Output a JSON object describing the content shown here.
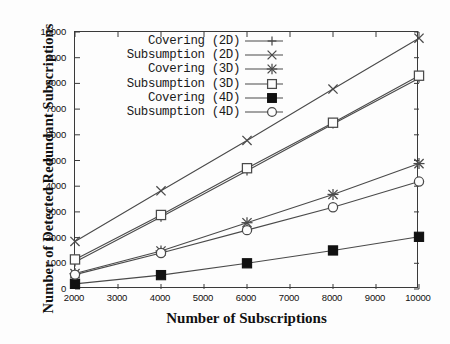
{
  "chart_data": {
    "type": "line",
    "title": "",
    "xlabel": "Number of Subscriptions",
    "ylabel": "Number of Detected Redundant Subscriptions",
    "xlim": [
      2000,
      10000
    ],
    "ylim": [
      0,
      10000
    ],
    "xticks": [
      2000,
      3000,
      4000,
      5000,
      6000,
      7000,
      8000,
      9000,
      10000
    ],
    "yticks": [
      0,
      1000,
      2000,
      3000,
      4000,
      5000,
      6000,
      7000,
      8000,
      9000,
      10000
    ],
    "grid": false,
    "legend_position": "upper-left-inside",
    "x": [
      2000,
      4000,
      6000,
      8000,
      10000
    ],
    "series": [
      {
        "name": "Covering (2D)",
        "marker": "plus",
        "values": [
          1050,
          2800,
          4600,
          6420,
          8200
        ]
      },
      {
        "name": "Subsumption (2D)",
        "marker": "cross",
        "values": [
          1850,
          3820,
          5780,
          7780,
          9760
        ]
      },
      {
        "name": "Covering (3D)",
        "marker": "star",
        "values": [
          600,
          1480,
          2580,
          3680,
          4880
        ]
      },
      {
        "name": "Subsumption (3D)",
        "marker": "open-square",
        "values": [
          1150,
          2880,
          4700,
          6470,
          8300
        ]
      },
      {
        "name": "Covering (4D)",
        "marker": "filled-square",
        "values": [
          200,
          540,
          1000,
          1500,
          2030
        ]
      },
      {
        "name": "Subsumption (4D)",
        "marker": "open-circle",
        "values": [
          560,
          1400,
          2290,
          3180,
          4180
        ]
      }
    ]
  },
  "legend": {
    "items": [
      {
        "label": "Covering (2D)"
      },
      {
        "label": "Subsumption (2D)"
      },
      {
        "label": "Covering (3D)"
      },
      {
        "label": "Subsumption (3D)"
      },
      {
        "label": "Covering (4D)"
      },
      {
        "label": "Subsumption (4D)"
      }
    ]
  },
  "axes": {
    "x_title": "Number of Subscriptions",
    "y_title": "Number of Detected Redundant Subscriptions",
    "x_tick_labels": [
      "2000",
      "3000",
      "4000",
      "5000",
      "6000",
      "7000",
      "8000",
      "9000",
      "10000"
    ],
    "y_tick_labels": [
      "0",
      "1000",
      "2000",
      "3000",
      "4000",
      "5000",
      "6000",
      "7000",
      "8000",
      "9000",
      "10000"
    ]
  },
  "colors": {
    "line": "#4a4a4a",
    "axis": "#3a3a3a",
    "text": "#111111",
    "marker_fill": "#111111",
    "background": "#fdfdfd"
  }
}
